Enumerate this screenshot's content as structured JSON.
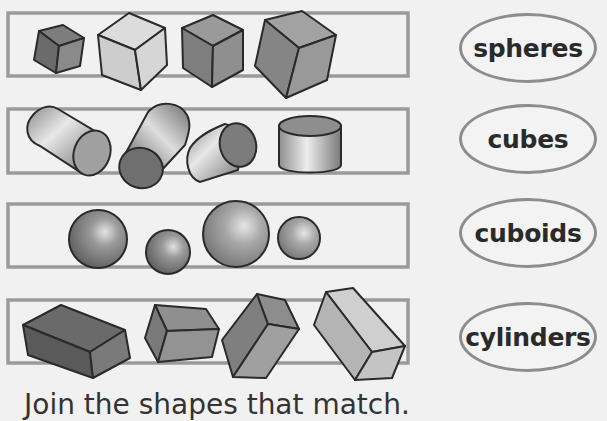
{
  "rows": [
    {
      "id": "cubes-row",
      "shape": "cube",
      "count": 4
    },
    {
      "id": "cylinders-row",
      "shape": "cylinder",
      "count": 4
    },
    {
      "id": "spheres-row",
      "shape": "sphere",
      "count": 4
    },
    {
      "id": "cuboids-row",
      "shape": "cuboid",
      "count": 4
    }
  ],
  "labels": [
    {
      "text": "spheres"
    },
    {
      "text": "cubes"
    },
    {
      "text": "cuboids"
    },
    {
      "text": "cylinders"
    }
  ],
  "instruction": "Join the shapes that match.",
  "colors": {
    "frame": "#9a9a9a",
    "outline": "#2a2a2a",
    "oval_border": "#8d8d8d",
    "background": "#f1f1f1"
  }
}
